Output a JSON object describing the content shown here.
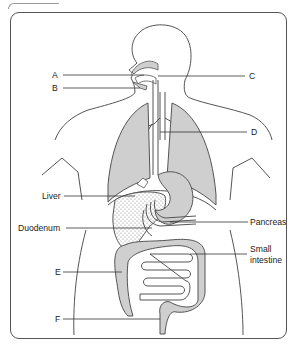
{
  "diagram": {
    "type": "human digestive system",
    "colors": {
      "organ_fill": "#cfcfcf",
      "outline": "#555555",
      "leader_line": "#333333",
      "liver_stipple": "#888888",
      "frame_border": "#555555"
    },
    "labels": {
      "A": "A",
      "B": "B",
      "C": "C",
      "D": "D",
      "liver": "Liver",
      "duodenum": "Duodenum",
      "pancreas": "Pancreas",
      "small_intestine_line1": "Small",
      "small_intestine_line2": "intestine",
      "E": "E",
      "F": "F"
    }
  }
}
